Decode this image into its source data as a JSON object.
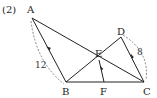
{
  "problem_label": "(2)",
  "points": {
    "A": "A",
    "B": "B",
    "C": "C",
    "D": "D",
    "E": "E",
    "F": "F"
  },
  "measurements": {
    "AB": "12",
    "DC": "8"
  },
  "segments": [
    "AB",
    "AC",
    "BD",
    "DC",
    "EF",
    "BC"
  ],
  "parallel_marks": [
    "AB",
    "EF",
    "DC"
  ],
  "colors": {
    "line": "#222222",
    "dashed": "#555555"
  }
}
